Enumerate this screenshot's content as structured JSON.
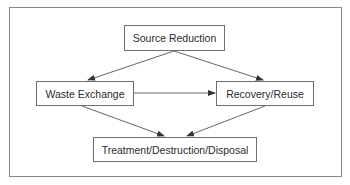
{
  "diagram": {
    "type": "flowchart",
    "nodes": [
      {
        "id": "source_reduction",
        "label": "Source Reduction",
        "x": 124,
        "y": 25,
        "w": 101,
        "h": 26
      },
      {
        "id": "waste_exchange",
        "label": "Waste Exchange",
        "x": 36,
        "y": 81,
        "w": 98,
        "h": 25
      },
      {
        "id": "recovery_reuse",
        "label": "Recovery/Reuse",
        "x": 216,
        "y": 81,
        "w": 98,
        "h": 25
      },
      {
        "id": "treatment",
        "label": "Treatment/Destruction/Disposal",
        "x": 93,
        "y": 137,
        "w": 164,
        "h": 25
      }
    ],
    "edges": [
      {
        "from": "source_reduction",
        "to": "waste_exchange"
      },
      {
        "from": "source_reduction",
        "to": "recovery_reuse"
      },
      {
        "from": "waste_exchange",
        "to": "recovery_reuse"
      },
      {
        "from": "waste_exchange",
        "to": "treatment"
      },
      {
        "from": "recovery_reuse",
        "to": "treatment"
      }
    ]
  },
  "labels": {
    "source_reduction": "Source Reduction",
    "waste_exchange": "Waste Exchange",
    "recovery_reuse": "Recovery/Reuse",
    "treatment": "Treatment/Destruction/Disposal"
  },
  "colors": {
    "line": "#555555",
    "border": "#6e6e6e",
    "text": "#2a2a2a",
    "frame": "#8a8a8a"
  }
}
